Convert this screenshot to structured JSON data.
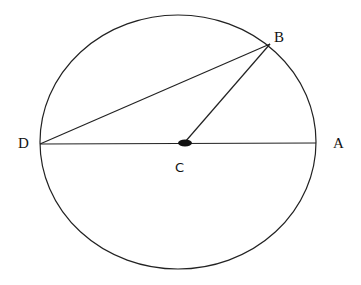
{
  "diagram": {
    "type": "circle-geometry",
    "points": {
      "A": {
        "label": "A",
        "x": 338,
        "y": 148
      },
      "B": {
        "label": "B",
        "x": 278,
        "y": 42
      },
      "C": {
        "label": "C",
        "x": 180,
        "y": 173
      },
      "D": {
        "label": "D",
        "x": 22,
        "y": 148
      }
    },
    "segments": [
      "DA",
      "DB",
      "CB"
    ],
    "center_label": "C",
    "stroke_color": "#222222",
    "background": "#ffffff"
  }
}
